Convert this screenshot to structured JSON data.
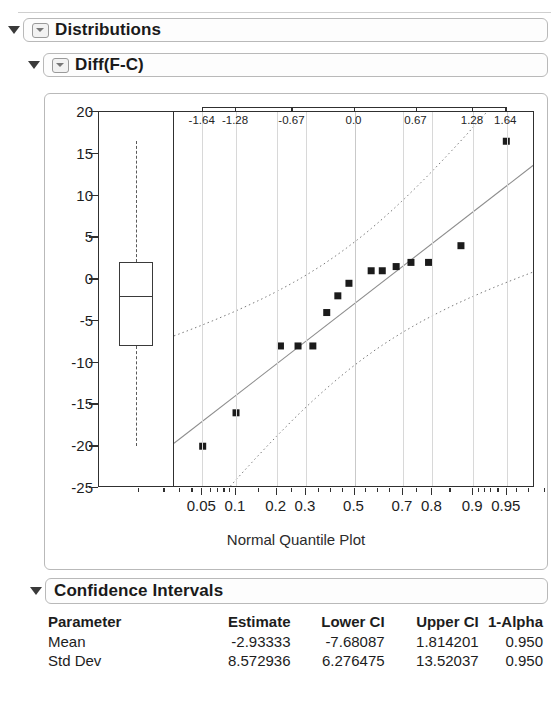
{
  "outline": {
    "distributions": {
      "label": "Distributions",
      "disclosure_icon": "disclosure-triangle-icon"
    },
    "diff": {
      "label": "Diff(F-C)",
      "disclosure_icon": "disclosure-triangle-icon"
    },
    "confidence_intervals": {
      "label": "Confidence Intervals",
      "disclosure_icon": "disclosure-triangle-icon"
    }
  },
  "chart_data": {
    "type": "scatter",
    "title": "Diff(F-C)",
    "caption": "Normal Quantile Plot",
    "xlabel": "",
    "ylabel": "",
    "ylim": [
      -25,
      20
    ],
    "y_ticks": [
      20,
      15,
      10,
      5,
      0,
      -5,
      -10,
      -15,
      -20,
      -25
    ],
    "top_axis_label": "Normal Quantile",
    "top_axis_ticks": [
      -1.64,
      -1.28,
      -0.67,
      0.0,
      0.67,
      1.28,
      1.64
    ],
    "top_axis_tick_labels": [
      "-1.64",
      "-1.28",
      "-0.67",
      "0.0",
      "0.67",
      "1.28",
      "1.64"
    ],
    "bottom_axis_label": "Probability",
    "bottom_axis_ticks": [
      0.05,
      0.1,
      0.2,
      0.3,
      0.5,
      0.7,
      0.8,
      0.9,
      0.95
    ],
    "bottom_axis_tick_labels": [
      "0.05",
      "0.1",
      "0.2",
      "0.3",
      "0.5",
      "0.7",
      "0.8",
      "0.9",
      "0.95"
    ],
    "grid": "vertical",
    "legend": "none",
    "points": [
      {
        "z": -1.64,
        "y": -20.0
      },
      {
        "z": -1.28,
        "y": -16.0
      },
      {
        "z": -0.8,
        "y": -8.0
      },
      {
        "z": -0.61,
        "y": -8.0
      },
      {
        "z": -0.45,
        "y": -8.0
      },
      {
        "z": -0.3,
        "y": -4.0
      },
      {
        "z": -0.18,
        "y": -2.0
      },
      {
        "z": -0.06,
        "y": -0.5
      },
      {
        "z": 0.18,
        "y": 1.0
      },
      {
        "z": 0.3,
        "y": 1.0
      },
      {
        "z": 0.45,
        "y": 1.5
      },
      {
        "z": 0.61,
        "y": 2.0
      },
      {
        "z": 0.8,
        "y": 2.0
      },
      {
        "z": 1.15,
        "y": 4.0
      },
      {
        "z": 1.64,
        "y": 16.5
      }
    ],
    "reference_line": {
      "style": "solid",
      "note": "normal fit line"
    },
    "confidence_bands": {
      "style": "dotted",
      "note": "95% confidence curves"
    },
    "boxplot": {
      "whisker_high": 16.5,
      "q3": 2.0,
      "median": -2.0,
      "q1": -8.0,
      "whisker_low": -20.0
    }
  },
  "ci_table": {
    "headers": [
      "Parameter",
      "Estimate",
      "Lower CI",
      "Upper CI",
      "1-Alpha"
    ],
    "rows": [
      {
        "parameter": "Mean",
        "estimate": "-2.93333",
        "lower_ci": "-7.68087",
        "upper_ci": "1.814201",
        "alpha": "0.950"
      },
      {
        "parameter": "Std Dev",
        "estimate": "8.572936",
        "lower_ci": "6.276475",
        "upper_ci": "13.52037",
        "alpha": "0.950"
      }
    ]
  },
  "colors": {
    "point": "#1b1b1b",
    "axis": "#303030",
    "grid": "#d8d8d8",
    "panel_border": "#b9b9b9"
  }
}
